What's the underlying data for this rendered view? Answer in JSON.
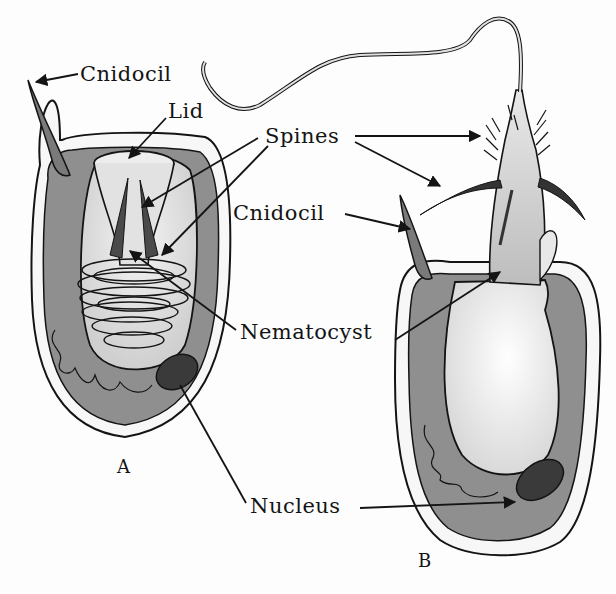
{
  "figure": {
    "panels": [
      {
        "id": "A",
        "caption": "A",
        "state": "undischarged"
      },
      {
        "id": "B",
        "caption": "B",
        "state": "discharged"
      }
    ]
  },
  "labels": {
    "cnidocil_a": "Cnidocil",
    "lid": "Lid",
    "spines": "Spines",
    "cnidocil_b": "Cnidocil",
    "nematocyst": "Nematocyst",
    "nucleus": "Nucleus",
    "caption_a": "A",
    "caption_b": "B"
  },
  "colors": {
    "ink": "#141414",
    "cytoplasm": "#8f8f8f",
    "capsule": "#e6e6e6",
    "nucleus": "#3a3a3a",
    "background": "#fdfdfd"
  }
}
